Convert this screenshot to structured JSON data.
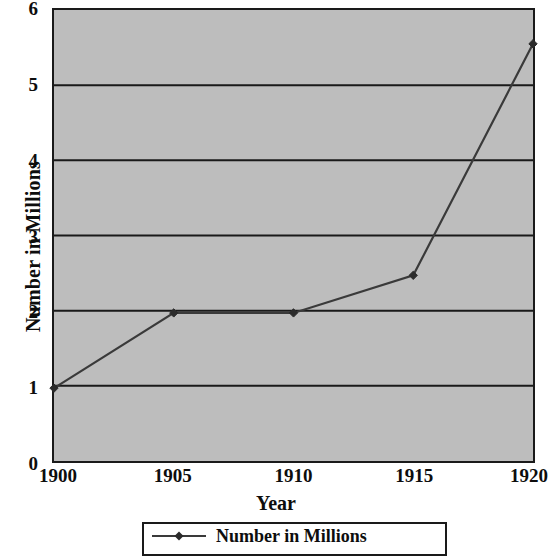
{
  "chart_data": {
    "type": "line",
    "title": "",
    "xlabel": "Year",
    "ylabel": "Number in Millions",
    "x": [
      1900,
      1905,
      1910,
      1915,
      1920
    ],
    "categories": [
      "1900",
      "1905",
      "1910",
      "1915",
      "1920"
    ],
    "series": [
      {
        "name": "Number in Millions",
        "values": [
          0.97,
          1.97,
          1.97,
          2.47,
          5.55
        ]
      }
    ],
    "xlim": [
      1900,
      1920
    ],
    "ylim": [
      0,
      6
    ],
    "y_ticks": [
      0,
      1,
      2,
      3,
      4,
      5,
      6
    ],
    "y_tick_labels": [
      "0",
      "1",
      "2",
      "3",
      "4",
      "5",
      "6"
    ],
    "x_ticks": [
      1900,
      1905,
      1910,
      1915,
      1920
    ],
    "x_tick_labels": [
      "1900",
      "1905",
      "1910",
      "1915",
      "1920"
    ],
    "grid": "horizontal",
    "legend_position": "bottom",
    "legend_entries": [
      "Number in Millions"
    ],
    "plot_background_color": "#bdbdbd",
    "line_color": "#3a3a3a",
    "marker_color": "#2b2b2b",
    "marker_shape": "diamond",
    "axis_color": "#1a1a1a",
    "text_color": "#0d0d0d"
  },
  "axes": {
    "y_title": "Number in Millions",
    "x_title": "Year",
    "y_labels": [
      "6",
      "5",
      "4",
      "3",
      "2",
      "1",
      "0"
    ],
    "x_labels": [
      "1900",
      "1905",
      "1910",
      "1915",
      "1920"
    ]
  },
  "legend": {
    "entry_label": "Number in Millions"
  }
}
